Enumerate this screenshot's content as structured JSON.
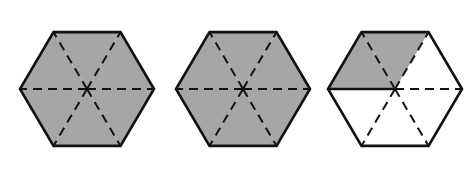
{
  "figure": {
    "colors": {
      "shade": "#a6a6a6",
      "stroke": "#111111",
      "background": "#ffffff"
    },
    "hexagons": [
      {
        "id": 1,
        "shaded_sixths": 6,
        "total_sixths": 6,
        "cx": 87,
        "cy": 89,
        "r": 67
      },
      {
        "id": 2,
        "shaded_sixths": 6,
        "total_sixths": 6,
        "cx": 243,
        "cy": 89,
        "r": 67
      },
      {
        "id": 3,
        "shaded_sixths": 2,
        "total_sixths": 6,
        "cx": 395,
        "cy": 89,
        "r": 67
      }
    ]
  }
}
